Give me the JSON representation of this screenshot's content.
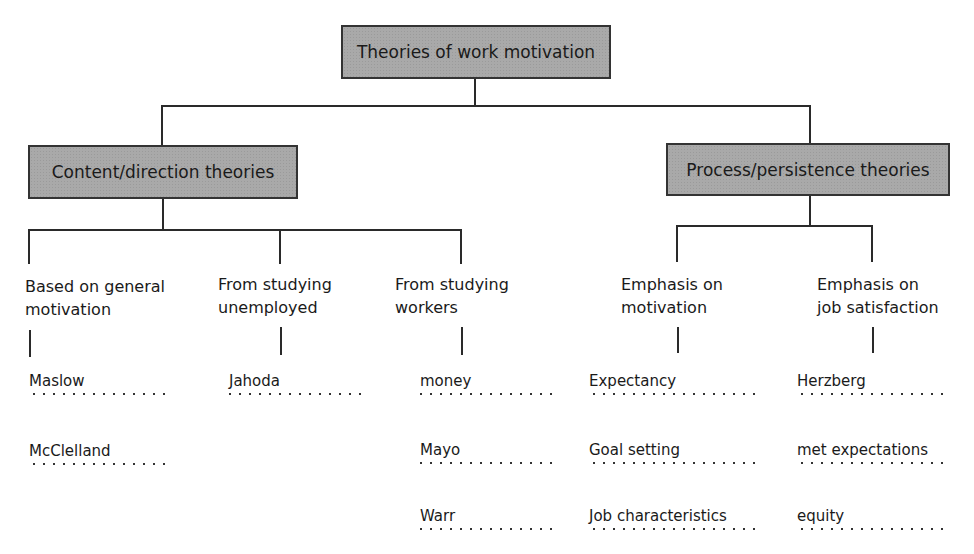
{
  "title": "Theories of work motivation",
  "categories": [
    {
      "label": "Content/direction theories",
      "subgroups": [
        {
          "label_lines": [
            "Based on general",
            "motivation"
          ],
          "items": [
            "Maslow",
            "McClelland"
          ]
        },
        {
          "label_lines": [
            "From studying",
            "unemployed"
          ],
          "items": [
            "Jahoda"
          ]
        },
        {
          "label_lines": [
            "From studying",
            "workers"
          ],
          "items": [
            "money",
            "Mayo",
            "Warr"
          ]
        }
      ]
    },
    {
      "label": "Process/persistence theories",
      "subgroups": [
        {
          "label_lines": [
            "Emphasis on",
            "motivation"
          ],
          "items": [
            "Expectancy",
            "Goal setting",
            "Job characteristics"
          ]
        },
        {
          "label_lines": [
            "Emphasis on",
            "job satisfaction"
          ],
          "items": [
            "Herzberg",
            "met expectations",
            "equity"
          ]
        }
      ]
    }
  ],
  "colors": {
    "box_fill": "#a9a9a9",
    "box_border": "#333333",
    "line": "#2a2a2a",
    "text": "#1a1a1a"
  }
}
